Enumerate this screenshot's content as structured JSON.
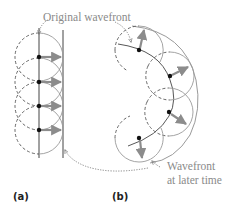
{
  "labels": {
    "original_wavefront": "Original wavefront",
    "later_wavefront_line1": "Wavefront",
    "later_wavefront_line2": "at later time",
    "panel_a": "(a)",
    "panel_b": "(b)"
  },
  "colors": {
    "wavelet_stroke": "#9a9a9a",
    "dashed_stroke": "#555555",
    "wavefront_stroke": "#444444",
    "arrow_fill": "#8c8c8c",
    "source_point": "#111111",
    "leader_line": "#777777",
    "label_text": "#8a8a8a"
  },
  "panel_a": {
    "original_wavefront_x": 39,
    "later_wavefront_x": 63,
    "source_points_y": [
      57,
      82,
      106,
      130
    ],
    "wavelet_radius": 24
  },
  "panel_b": {
    "source_points": [
      [
        139,
        50
      ],
      [
        170,
        76
      ],
      [
        169,
        112
      ],
      [
        139,
        138
      ]
    ],
    "wavelet_radius": 24
  }
}
